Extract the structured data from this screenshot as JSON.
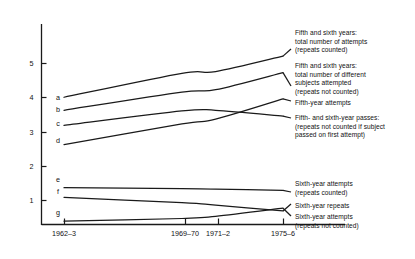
{
  "chart_data": {
    "type": "line",
    "title": "",
    "xlabel": "",
    "ylabel": "",
    "x_tick_labels": [
      "1962–3",
      "1969–70",
      "1971–2",
      "1975–6"
    ],
    "x_tick_values": [
      1962.5,
      1969.5,
      1971.5,
      1975.5
    ],
    "y_tick_labels": [
      "1",
      "2",
      "3",
      "4",
      "5"
    ],
    "y_tick_values": [
      1,
      2,
      3,
      4,
      5
    ],
    "ylim": [
      0,
      6
    ],
    "xlim": [
      1962.5,
      1975.5
    ],
    "grid": false,
    "legend_position": "right",
    "series": [
      {
        "key": "a",
        "name": "Fifth and sixth years: total number of attempts (repeats counted)",
        "x": [
          1962.5,
          1969.5,
          1971.5,
          1975.5
        ],
        "values": [
          4.0,
          4.7,
          4.75,
          5.2
        ]
      },
      {
        "key": "b",
        "name": "Fifth and sixth years: total number of different subjects attempted (repeats not counted)",
        "x": [
          1962.5,
          1969.5,
          1971.5,
          1975.5
        ],
        "values": [
          3.62,
          4.15,
          4.22,
          4.72
        ]
      },
      {
        "key": "c",
        "name": "Fifth- and sixth-year passes: (repeats not counted if subject passed on first attempt)",
        "x": [
          1962.5,
          1969.5,
          1971.5,
          1975.5
        ],
        "values": [
          3.18,
          3.6,
          3.62,
          3.45
        ]
      },
      {
        "key": "d",
        "name": "Fifth-year attempts",
        "x": [
          1962.5,
          1969.5,
          1971.5,
          1975.5
        ],
        "values": [
          2.62,
          3.22,
          3.36,
          3.95
        ]
      },
      {
        "key": "e",
        "name": "Sixth-year attempts (repeats counted)",
        "x": [
          1962.5,
          1969.5,
          1971.5,
          1975.5
        ],
        "values": [
          1.36,
          1.33,
          1.32,
          1.28
        ]
      },
      {
        "key": "f",
        "name": "Sixth-year repeats",
        "x": [
          1962.5,
          1969.5,
          1971.5,
          1975.5
        ],
        "values": [
          1.08,
          0.92,
          0.85,
          0.68
        ]
      },
      {
        "key": "g",
        "name": "Sixth-year attempts (repeats not counted)",
        "x": [
          1962.5,
          1969.5,
          1971.5,
          1975.5
        ],
        "values": [
          0.38,
          0.46,
          0.52,
          0.76
        ]
      }
    ]
  },
  "axis": {
    "y_ticks": [
      {
        "label": "5",
        "y": 63
      },
      {
        "label": "4",
        "y": 97
      },
      {
        "label": "3",
        "y": 132
      },
      {
        "label": "2",
        "y": 166
      },
      {
        "label": "1",
        "y": 200
      }
    ],
    "x_ticks": [
      {
        "label": "1962–3",
        "x": 64
      },
      {
        "label": "1969–70",
        "x": 185
      },
      {
        "label": "1971–2",
        "x": 218
      },
      {
        "label": "1975–6",
        "x": 283
      }
    ]
  },
  "series_keys": [
    {
      "key": "a",
      "x": 58,
      "y": 100
    },
    {
      "key": "b",
      "x": 58,
      "y": 112
    },
    {
      "key": "c",
      "x": 58,
      "y": 126
    },
    {
      "key": "d",
      "x": 58,
      "y": 143
    },
    {
      "key": "e",
      "x": 58,
      "y": 182
    },
    {
      "key": "f",
      "x": 58,
      "y": 194
    },
    {
      "key": "g",
      "x": 58,
      "y": 215
    }
  ],
  "legend": [
    {
      "id": "legend-a",
      "lines": [
        "Fifth and sixth years:",
        "total number of attempts",
        "(repeats counted)"
      ],
      "left": 295,
      "top": 29
    },
    {
      "id": "legend-b",
      "lines": [
        "Fifth and sixth years:",
        "total number of different",
        "subjects attempted",
        "(repeats not counted)"
      ],
      "left": 295,
      "top": 62
    },
    {
      "id": "legend-d",
      "lines": [
        "Fifth-year attempts"
      ],
      "left": 295,
      "top": 99
    },
    {
      "id": "legend-c",
      "lines": [
        "Fifth- and sixth-year passes:",
        "(repeats not counted if subject",
        "passed on first attempt)"
      ],
      "left": 295,
      "top": 114
    },
    {
      "id": "legend-e",
      "lines": [
        "Sixth-year attempts",
        "(repeats counted)"
      ],
      "left": 295,
      "top": 180
    },
    {
      "id": "legend-f",
      "lines": [
        "Sixth-year repeats"
      ],
      "left": 295,
      "top": 202
    },
    {
      "id": "legend-g",
      "lines": [
        "Sixth-year attempts",
        "(repeats not counted)"
      ],
      "left": 295,
      "top": 213
    }
  ],
  "style": {
    "line_color": "#1a1a1a",
    "axis_color": "#1a1a1a",
    "background": "#ffffff"
  }
}
